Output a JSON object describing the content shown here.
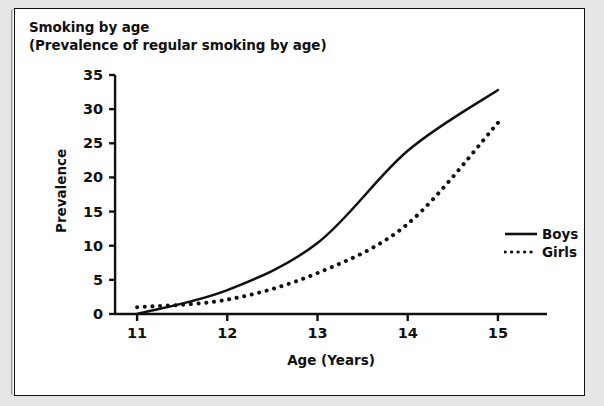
{
  "figure": {
    "title_line1": "Smoking by age",
    "title_line2": "(Prevalence of regular smoking by age)"
  },
  "legend": {
    "position": "right-middle",
    "items": [
      {
        "label": "Boys",
        "style": "solid",
        "color": "#111111"
      },
      {
        "label": "Girls",
        "style": "dotted",
        "color": "#111111"
      }
    ]
  },
  "chart_data": {
    "type": "line",
    "title": "Smoking by age (Prevalence of regular smoking by age)",
    "xlabel": "Age (Years)",
    "ylabel": "Prevalence",
    "x": [
      11,
      12,
      13,
      14,
      15
    ],
    "xtick_labels": [
      "11",
      "12",
      "13",
      "14",
      "15"
    ],
    "ytick_labels": [
      "0",
      "5",
      "10",
      "15",
      "20",
      "25",
      "30",
      "35"
    ],
    "yticks": [
      0,
      5,
      10,
      15,
      20,
      25,
      30,
      35
    ],
    "xlim": [
      10.6,
      15.3
    ],
    "ylim": [
      0,
      35
    ],
    "grid": false,
    "legend_position": "right-middle",
    "series": [
      {
        "name": "Boys",
        "style": "solid",
        "color": "#111111",
        "values": [
          0,
          3.5,
          10.4,
          23.9,
          32.8
        ]
      },
      {
        "name": "Girls",
        "style": "dotted",
        "color": "#111111",
        "values": [
          1,
          2.1,
          6,
          13.2,
          28
        ]
      }
    ]
  }
}
